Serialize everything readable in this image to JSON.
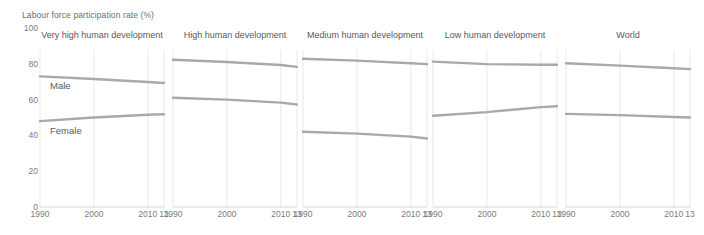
{
  "chart_data": {
    "type": "line",
    "title": "Labour force participation rate (%)",
    "ylabel": "Labour force participation rate (%)",
    "xlabel": "",
    "ylim": [
      0,
      100
    ],
    "yticks": [
      0,
      20,
      40,
      60,
      80,
      100
    ],
    "x": [
      1990,
      2000,
      2010,
      2013
    ],
    "xticks": [
      1990,
      2000,
      2010,
      2013
    ],
    "xtick_labels": [
      "1990",
      "2000",
      "2010",
      "13"
    ],
    "grid": true,
    "legend": "inline",
    "series_names": [
      "Male",
      "Female"
    ],
    "series_colors": {
      "male": "#a7a9ac",
      "female": "#a7a9ac"
    },
    "panels": [
      {
        "title": "Very high human development",
        "series": [
          {
            "name": "Male",
            "values": [
              73,
              71.5,
              69.8,
              69.3
            ]
          },
          {
            "name": "Female",
            "values": [
              48,
              50,
              51.5,
              51.8
            ]
          }
        ]
      },
      {
        "title": "High human development",
        "series": [
          {
            "name": "Male",
            "values": [
              82.3,
              81,
              79.3,
              78.3
            ]
          },
          {
            "name": "Female",
            "values": [
              61,
              60,
              58.3,
              57.3
            ]
          }
        ]
      },
      {
        "title": "Medium human development",
        "series": [
          {
            "name": "Male",
            "values": [
              82.8,
              81.8,
              80.3,
              79.8
            ]
          },
          {
            "name": "Female",
            "values": [
              42,
              41,
              39.3,
              38.3
            ]
          }
        ]
      },
      {
        "title": "Low human development",
        "series": [
          {
            "name": "Male",
            "values": [
              81.2,
              79.8,
              79.5,
              79.5
            ]
          },
          {
            "name": "Female",
            "values": [
              51,
              53,
              55.8,
              56.3
            ]
          }
        ]
      },
      {
        "title": "World",
        "series": [
          {
            "name": "Male",
            "values": [
              80.3,
              79,
              77.5,
              77
            ]
          },
          {
            "name": "Female",
            "values": [
              52,
              51.3,
              50.3,
              50
            ]
          }
        ]
      }
    ],
    "annotations": [
      {
        "text": "Male",
        "panel": 0
      },
      {
        "text": "Female",
        "panel": 0
      }
    ]
  }
}
